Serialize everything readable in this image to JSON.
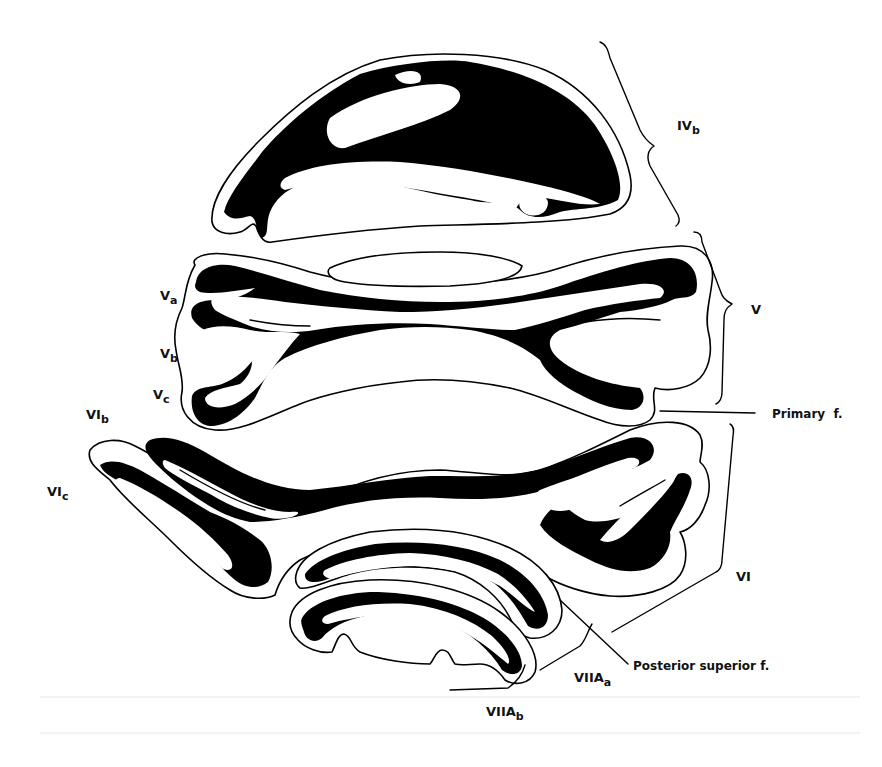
{
  "figure": {
    "lobule_labels": [
      {
        "id": "IVb",
        "base": "IV",
        "sub": "b"
      },
      {
        "id": "Va",
        "base": "V",
        "sub": "a"
      },
      {
        "id": "Vb",
        "base": "V",
        "sub": "b"
      },
      {
        "id": "Vc",
        "base": "V",
        "sub": "c"
      },
      {
        "id": "V",
        "base": "V",
        "sub": ""
      },
      {
        "id": "VIb",
        "base": "VI",
        "sub": "b"
      },
      {
        "id": "VIc",
        "base": "VI",
        "sub": "c"
      },
      {
        "id": "VI",
        "base": "VI",
        "sub": ""
      },
      {
        "id": "VIIAa",
        "base": "VIIA",
        "sub": "a"
      },
      {
        "id": "VIIAb",
        "base": "VIIA",
        "sub": "b"
      }
    ],
    "fissure_labels": [
      {
        "id": "primary",
        "text": "Primary  f."
      },
      {
        "id": "posterior_superior",
        "text": "Posterior superior f."
      }
    ],
    "colors": {
      "background": "#ffffff",
      "ink": "#000000"
    }
  }
}
